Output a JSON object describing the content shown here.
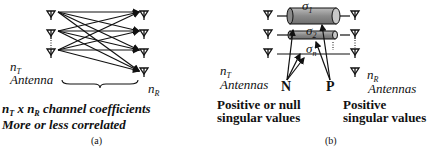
{
  "panel_a": {
    "tx_label_var": "n",
    "tx_label_sub": "T",
    "tx_label_word": "Antenna",
    "rx_label_var": "n",
    "rx_label_sub": "R",
    "caption_line1_a": "n",
    "caption_line1_a_sub": "T",
    "caption_line1_x": " x ",
    "caption_line1_b": "n",
    "caption_line1_b_sub": "R",
    "caption_line1_rest": " channel coefficients",
    "caption_line2": "More or less correlated",
    "panel_label": "(a)",
    "tx_antennas": 3,
    "rx_antennas": 4
  },
  "panel_b": {
    "sigma_1": "σ",
    "sigma_1_sub": "1",
    "sigma_2": "σ",
    "sigma_2_sub": "2",
    "sigma_n": "σ",
    "sigma_n_sub": "n",
    "tx_label_var": "n",
    "tx_label_sub": "T",
    "tx_label_word": "Antennas",
    "rx_label_var": "n",
    "rx_label_sub": "R",
    "rx_label_word": "Antennas",
    "n_label": "N",
    "p_label": "P",
    "n_desc_line1": "Positive or null",
    "n_desc_line2": "singular values",
    "p_desc_line1": "Positive",
    "p_desc_line2": "singular values",
    "panel_label": "(b)",
    "cylinder_color": "#888888"
  }
}
